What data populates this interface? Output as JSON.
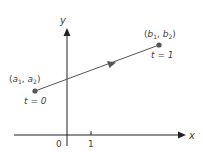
{
  "diagram": {
    "axes": {
      "x_label": "x",
      "y_label": "y",
      "origin_label": "0",
      "tick_label": "1"
    },
    "start_point": {
      "label_a": "a",
      "sub_a1": "1",
      "sub_a2": "2",
      "param_label": "t = 0"
    },
    "end_point": {
      "label_b": "b",
      "sub_b1": "1",
      "sub_b2": "2",
      "param_label": "t = 1"
    },
    "colors": {
      "axis": "#222222",
      "segment": "#555555",
      "point": "#555555",
      "text": "#444444"
    }
  }
}
